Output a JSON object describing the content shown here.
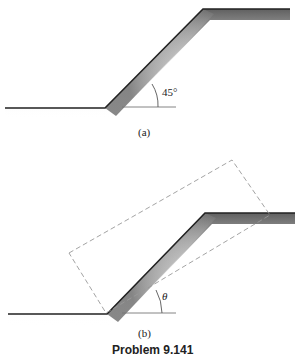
{
  "panel_a": {
    "caption": "(a)",
    "angle_label": "45°"
  },
  "panel_b": {
    "caption": "(b)",
    "angle_label": "θ"
  },
  "figure_caption": "Problem 9.141",
  "colors": {
    "ground_line": "#222222",
    "dashed_box": "#999999",
    "reference_line": "#777777"
  }
}
